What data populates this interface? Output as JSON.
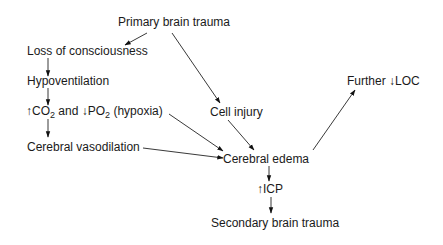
{
  "diagram": {
    "type": "flowchart",
    "nodes": {
      "primary": {
        "label": "Primary brain trauma"
      },
      "loc": {
        "label": "Loss of consciousness"
      },
      "hypovent": {
        "label": "Hypoventilation"
      },
      "gas": {
        "up_arrow": "↑",
        "co": "CO",
        "sub1": "2",
        "mid": " and ",
        "down_arrow": "↓",
        "po": "PO",
        "sub2": "2",
        "tail": " (hypoxia)"
      },
      "vasodilation": {
        "label": "Cerebral vasodilation"
      },
      "cell_injury": {
        "label": "Cell injury"
      },
      "edema": {
        "label": "Cerebral edema"
      },
      "icp": {
        "up_arrow": "↑",
        "label": "ICP"
      },
      "secondary": {
        "label": "Secondary brain trauma"
      },
      "further_loc": {
        "prefix": "Further ",
        "down_arrow": "↓",
        "label": "LOC"
      }
    },
    "edges": [
      {
        "from": "Primary brain trauma",
        "to": "Loss of consciousness"
      },
      {
        "from": "Primary brain trauma",
        "to": "Cell injury"
      },
      {
        "from": "Loss of consciousness",
        "to": "Hypoventilation"
      },
      {
        "from": "Hypoventilation",
        "to": "↑CO2 and ↓PO2 (hypoxia)"
      },
      {
        "from": "↑CO2 and ↓PO2 (hypoxia)",
        "to": "Cerebral vasodilation"
      },
      {
        "from": "↑CO2 and ↓PO2 (hypoxia)",
        "to": "Cerebral edema"
      },
      {
        "from": "Cerebral vasodilation",
        "to": "Cerebral edema"
      },
      {
        "from": "Cell injury",
        "to": "Cerebral edema"
      },
      {
        "from": "Cerebral edema",
        "to": "Further ↓LOC"
      },
      {
        "from": "Cerebral edema",
        "to": "↑ICP"
      },
      {
        "from": "↑ICP",
        "to": "Secondary brain trauma"
      }
    ]
  }
}
